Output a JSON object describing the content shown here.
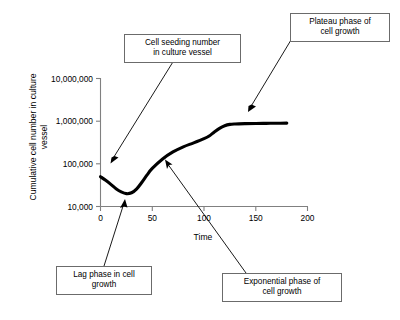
{
  "chart_data": {
    "type": "line",
    "title": "",
    "xlabel": "Time",
    "ylabel": "Cumulative cell number in culture vessel",
    "yscale": "log",
    "xscale": "linear",
    "xlim": [
      0,
      200
    ],
    "ylim": [
      10000,
      10000000
    ],
    "grid": false,
    "legend": "none",
    "xticks": [
      "0",
      "50",
      "100",
      "150",
      "200"
    ],
    "xtick_values": [
      0,
      50,
      100,
      150,
      200
    ],
    "yticks": [
      "10,000",
      "100,000",
      "1,000,000",
      "10,000,000"
    ],
    "ytick_values": [
      10000,
      100000,
      1000000,
      10000000
    ],
    "series": [
      {
        "name": "Cumulative cell number",
        "x": [
          0,
          5,
          10,
          15,
          20,
          25,
          30,
          35,
          40,
          45,
          50,
          60,
          70,
          80,
          90,
          100,
          105,
          110,
          115,
          120,
          125,
          130,
          140,
          150,
          160,
          170,
          180
        ],
        "y": [
          50000,
          41000,
          33000,
          26000,
          22000,
          20000,
          21000,
          26000,
          37000,
          55000,
          78000,
          130000,
          190000,
          250000,
          310000,
          390000,
          450000,
          560000,
          680000,
          780000,
          840000,
          860000,
          875000,
          885000,
          890000,
          895000,
          900000
        ]
      }
    ],
    "annotations": [
      {
        "id": "seeding",
        "text_line1": "Cell seeding number",
        "text_line2": "in culture vessel",
        "points_to_x": 5,
        "points_to_y": 50000
      },
      {
        "id": "lag",
        "text_line1": "Lag phase in cell",
        "text_line2": "growth",
        "points_to_x": 25,
        "points_to_y": 20000
      },
      {
        "id": "exponential",
        "text_line1": "Exponential phase of",
        "text_line2": "cell growth",
        "points_to_x": 63,
        "points_to_y": 140000
      },
      {
        "id": "plateau",
        "text_line1": "Plateau phase of",
        "text_line2": "cell growth",
        "points_to_x": 143,
        "points_to_y": 880000
      }
    ]
  },
  "axis": {
    "y_title_text": "Cumulative cell number in culture vessel",
    "x_title_text": "Time",
    "ytick_0": "10,000,000",
    "ytick_1": "1,000,000",
    "ytick_2": "100,000",
    "ytick_3": "10,000",
    "xtick_0": "0",
    "xtick_1": "50",
    "xtick_2": "100",
    "xtick_3": "150",
    "xtick_4": "200"
  },
  "callouts": {
    "seeding": {
      "line1": "Cell seeding number",
      "line2": "in culture vessel"
    },
    "plateau": {
      "line1": "Plateau phase of",
      "line2": "cell growth"
    },
    "lag": {
      "line1": "Lag phase in cell",
      "line2": "growth"
    },
    "exponential": {
      "line1": "Exponential phase of",
      "line2": "cell growth"
    }
  },
  "colors": {
    "curve": "#000000",
    "axis": "#808080",
    "box_border": "#6b6b6b",
    "background": "#ffffff"
  }
}
